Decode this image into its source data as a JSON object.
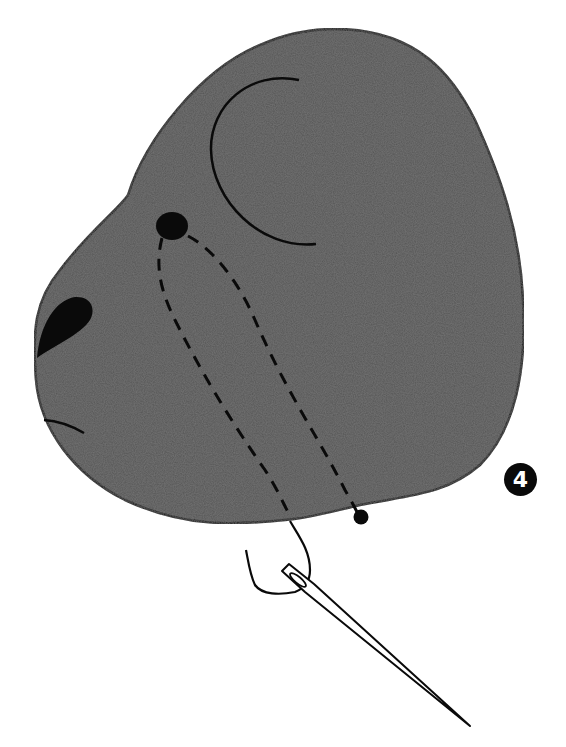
{
  "illustration": {
    "subject": "stuffed toy head fabric piece with eye stitching",
    "step_number": "4",
    "colors": {
      "fabric_fill": "#555555",
      "outline": "#0a0a0a",
      "background": "#ffffff",
      "badge_bg": "#0a0a0a",
      "badge_text": "#ffffff"
    },
    "elements": [
      "head-fabric-piece",
      "ear-seam-line",
      "eye-bead",
      "nose-patch",
      "mouth-line",
      "dashed-thread-path-left",
      "dashed-thread-path-right",
      "thread-knot",
      "thread-loop",
      "sewing-needle"
    ]
  }
}
